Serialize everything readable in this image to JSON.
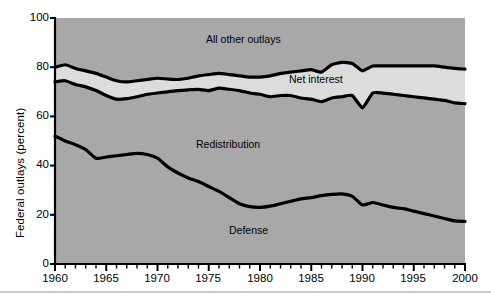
{
  "chart_data": {
    "type": "area",
    "title": "",
    "xlabel": "",
    "ylabel": "Federal outlays (percent)",
    "xlim": [
      1960,
      2000
    ],
    "ylim": [
      0,
      100
    ],
    "grid": false,
    "legend_position": "inline-annotations",
    "stacked": true,
    "x": [
      1960,
      1961,
      1962,
      1963,
      1964,
      1965,
      1966,
      1967,
      1968,
      1969,
      1970,
      1971,
      1972,
      1973,
      1974,
      1975,
      1976,
      1977,
      1978,
      1979,
      1980,
      1981,
      1982,
      1983,
      1984,
      1985,
      1986,
      1987,
      1988,
      1989,
      1990,
      1991,
      1992,
      1993,
      1994,
      1995,
      1996,
      1997,
      1998,
      1999,
      2000
    ],
    "xticks": [
      1960,
      1965,
      1970,
      1975,
      1980,
      1985,
      1990,
      1995,
      2000
    ],
    "xtick_labels": [
      "1960",
      "1965",
      "1970",
      "1975",
      "1980",
      "1985",
      "1990",
      "1995",
      "2000"
    ],
    "yticks": [
      0,
      20,
      40,
      60,
      80,
      100
    ],
    "ytick_labels": [
      "0",
      "20",
      "40",
      "60",
      "80",
      "100"
    ],
    "minor_xticks_per_interval": 5,
    "series": [
      {
        "name": "Defense",
        "label": "Defense",
        "color": "#a8a8a8",
        "cumulative_top": true,
        "values": [
          52,
          50,
          48.5,
          46.5,
          43,
          43.5,
          44,
          44.5,
          45,
          44.5,
          43,
          39.5,
          37,
          35,
          33.5,
          31.5,
          29.5,
          27,
          24.5,
          23.3,
          23,
          23.5,
          24.5,
          25.5,
          26.5,
          27,
          27.8,
          28.3,
          28.5,
          27.5,
          24,
          25,
          24,
          23,
          22.5,
          21.5,
          20.5,
          19.5,
          18.5,
          17.5,
          17.3
        ]
      },
      {
        "name": "Redistribution",
        "label": "Redistribution",
        "color": "#a8a8a8",
        "cumulative_values": [
          74,
          74.5,
          73,
          72,
          70.5,
          68.5,
          67,
          67.2,
          68,
          69,
          69.5,
          70,
          70.5,
          70.8,
          71,
          70.5,
          71.5,
          71,
          70.5,
          69.5,
          69,
          68,
          68.5,
          68.5,
          67.5,
          67,
          66,
          67.5,
          68,
          68.5,
          63.5,
          69.5,
          69.5,
          69,
          68.5,
          68,
          67.5,
          67,
          66.5,
          65.5,
          65.2
        ]
      },
      {
        "name": "Net interest",
        "label": "Net interest",
        "color": "#dcdcdc",
        "cumulative_values": [
          80,
          81,
          79.5,
          78.5,
          77.5,
          76,
          74.5,
          74,
          74.5,
          75,
          75.5,
          75.2,
          75,
          75.5,
          76.5,
          77,
          77.5,
          77,
          76.5,
          76,
          76,
          76.5,
          77.5,
          78,
          78.5,
          79,
          78,
          81,
          82,
          81.5,
          78.5,
          80.5,
          80.5,
          80.5,
          80.5,
          80.5,
          80.5,
          80.5,
          80,
          79.5,
          79.2
        ]
      },
      {
        "name": "All other outlays",
        "label": "All other outlays",
        "color": "#a8a8a8",
        "cumulative_values": [
          100,
          100,
          100,
          100,
          100,
          100,
          100,
          100,
          100,
          100,
          100,
          100,
          100,
          100,
          100,
          100,
          100,
          100,
          100,
          100,
          100,
          100,
          100,
          100,
          100,
          100,
          100,
          100,
          100,
          100,
          100,
          100,
          100,
          100,
          100,
          100,
          100,
          100,
          100,
          100,
          100
        ]
      }
    ],
    "annotations": [
      {
        "text": "All other outlays",
        "x": 1978,
        "y": 90
      },
      {
        "text": "Net interest",
        "x": 1987,
        "y": 72
      },
      {
        "text": "Redistribution",
        "x": 1977,
        "y": 50
      },
      {
        "text": "Defense",
        "x": 1979,
        "y": 13
      }
    ]
  },
  "axis": {
    "ylabel": "Federal outlays (percent)",
    "ytick_labels": [
      "100",
      "80",
      "60",
      "40",
      "20",
      "0"
    ],
    "xtick_labels": [
      "1960",
      "1965",
      "1970",
      "1975",
      "1980",
      "1985",
      "1990",
      "1995",
      "2000"
    ]
  },
  "labels": {
    "all_other_outlays": "All other outlays",
    "net_interest": "Net interest",
    "redistribution": "Redistribution",
    "defense": "Defense"
  },
  "colors": {
    "area_gray": "#a8a8a8",
    "net_interest_gray": "#dcdcdc",
    "line": "#000000",
    "background": "#ffffff"
  }
}
